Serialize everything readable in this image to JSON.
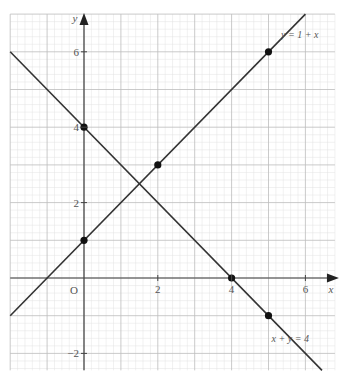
{
  "chart_data": {
    "type": "line",
    "title": "",
    "xlabel": "x",
    "ylabel": "y",
    "origin_label": "O",
    "xlim": [
      -2.0,
      6.8
    ],
    "ylim": [
      -2.45,
      7.0
    ],
    "grid": {
      "major": 1,
      "minor": 0.2,
      "on": true
    },
    "x_ticks": [
      2,
      4,
      6
    ],
    "x_tick_labels": [
      "2",
      "4",
      "6"
    ],
    "y_ticks": [
      -2,
      2,
      4,
      6
    ],
    "y_tick_labels": [
      "−2",
      "2",
      "4",
      "6"
    ],
    "series": [
      {
        "name": "y = 1 + x",
        "label": "y = 1 + x",
        "equation": {
          "slope": 1,
          "intercept": 1
        },
        "points": [
          [
            0,
            1
          ],
          [
            2,
            3
          ],
          [
            5,
            6
          ]
        ],
        "label_position": [
          6.1,
          6.0
        ]
      },
      {
        "name": "x + y = 4",
        "label": "x + y = 4",
        "equation": {
          "slope": -1,
          "intercept": 4
        },
        "points": [
          [
            0,
            4
          ],
          [
            4,
            0
          ],
          [
            5,
            -1
          ]
        ],
        "label_position": [
          5.3,
          -1.6
        ]
      }
    ],
    "intersection": [
      1.5,
      2.5
    ]
  },
  "style": {
    "line_color": "#333333",
    "axis_color": "#444444",
    "major_grid_color": "#bdbdbd",
    "minor_grid_color": "#e2e2e2",
    "point_color": "#111111"
  }
}
